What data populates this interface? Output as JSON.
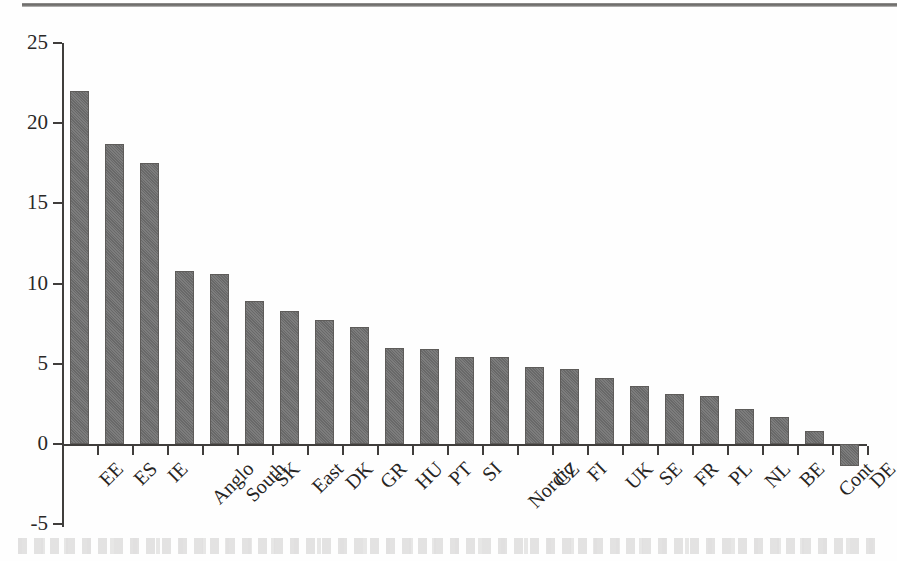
{
  "chart_data": {
    "type": "bar",
    "title": "",
    "subtitle": "",
    "xlabel": "",
    "ylabel": "",
    "categories": [
      "EE",
      "ES",
      "IE",
      "Anglo",
      "South",
      "SK",
      "East",
      "DK",
      "GR",
      "HU",
      "PT",
      "SI",
      "Nordic",
      "CZ",
      "FI",
      "UK",
      "SE",
      "FR",
      "PL",
      "NL",
      "BE",
      "Cont",
      "DE"
    ],
    "values": [
      22.0,
      18.7,
      17.5,
      10.8,
      10.6,
      8.9,
      8.3,
      7.7,
      7.3,
      6.0,
      5.9,
      5.4,
      5.4,
      4.8,
      4.7,
      4.1,
      3.6,
      3.1,
      3.0,
      2.2,
      1.7,
      0.8,
      -1.4
    ],
    "ylim": [
      -5,
      25
    ],
    "ytick_labels": [
      "25",
      "20",
      "15",
      "10",
      "5",
      "0",
      "-5"
    ],
    "ytick_values": [
      25,
      20,
      15,
      10,
      5,
      0,
      -5
    ],
    "grid": false,
    "legend": null,
    "bar_color": "#6e6e6e",
    "axis_color": "#403e3c",
    "background_color": "#fefefe"
  }
}
